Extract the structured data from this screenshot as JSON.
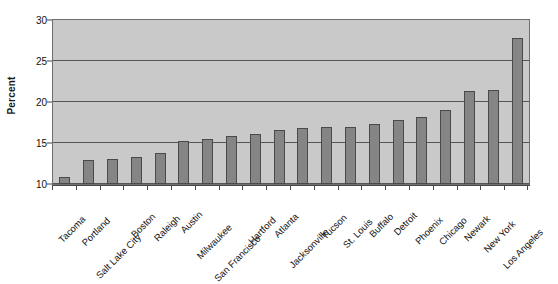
{
  "chart_data": {
    "type": "bar",
    "title": "",
    "xlabel": "",
    "ylabel": "Percent",
    "ylim": [
      10,
      30
    ],
    "yticks": [
      10,
      15,
      20,
      25,
      30
    ],
    "ytick_labels": [
      "10",
      "15",
      "20",
      "25",
      "30"
    ],
    "grid": true,
    "legend": null,
    "orientation": "vertical",
    "categories": [
      "Tacoma",
      "Portland",
      "Salt Lake City",
      "Boston",
      "Raleigh",
      "Austin",
      "Milwaukee",
      "San Francisco",
      "Hartford",
      "Atlanta",
      "Jacksonville",
      "Tucson",
      "St. Louis",
      "Buffalo",
      "Detroit",
      "Phoenix",
      "Chicago",
      "Newark",
      "New York",
      "Los Angeles"
    ],
    "values": [
      10.8,
      12.9,
      13.1,
      13.3,
      13.8,
      15.3,
      15.5,
      15.9,
      16.1,
      16.6,
      16.8,
      16.9,
      17.0,
      17.3,
      17.8,
      18.2,
      19.0,
      21.4,
      21.5,
      27.8
    ],
    "colors": {
      "bar_fill": "#858585",
      "bar_border": "#4a4a4a",
      "plot_background": "#c9c9c9",
      "gridline": "#555555",
      "axis": "#4a4a4a",
      "text": "#111111",
      "page_background": "#ffffff"
    }
  }
}
